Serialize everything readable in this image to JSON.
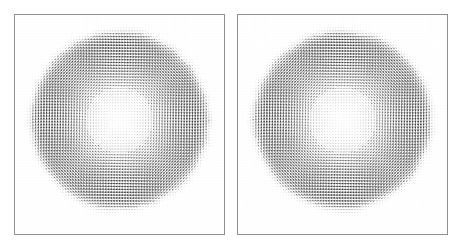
{
  "figure": {
    "title": "",
    "width": 462,
    "height": 247,
    "background_color": "#ffffff",
    "panel_count": 2
  },
  "style": {
    "border_color": "#8f8f8f",
    "border_width": 1,
    "arrow_color": "#1a1a1a",
    "background_grid_color": "#e8e8e8",
    "panel_background": "#ffffff"
  },
  "panels": [
    {
      "name": "left-panel",
      "label": "",
      "x": 14,
      "y": 14,
      "width": 211,
      "height": 221
    },
    {
      "name": "right-panel",
      "label": "",
      "x": 237,
      "y": 14,
      "width": 211,
      "height": 221
    }
  ],
  "chart_data": {
    "type": "scatter",
    "subtype": "quiver-vector-field",
    "title": "",
    "xlabel": "",
    "ylabel": "",
    "xlim": [
      0,
      1
    ],
    "ylim": [
      0,
      1
    ],
    "grid": true,
    "legend": null,
    "tick_labels": {
      "x": [],
      "y": []
    },
    "annotations": [],
    "panels": [
      {
        "name": "left-panel",
        "grid_nx": 76,
        "grid_ny": 76,
        "field": "vortex",
        "rotation": "counter-clockwise",
        "center_norm": [
          0.5,
          0.48
        ],
        "support_radius_norm": 0.225,
        "core_radius_norm": 0.055,
        "peak_radius_norm": 0.185,
        "max_arrow_length_px": 3.6,
        "background_arrow_length_px": 0.45,
        "edge_roughness": 0.035
      },
      {
        "name": "right-panel",
        "grid_nx": 76,
        "grid_ny": 76,
        "field": "vortex",
        "rotation": "counter-clockwise",
        "center_norm": [
          0.5,
          0.48
        ],
        "support_radius_norm": 0.225,
        "core_radius_norm": 0.055,
        "peak_radius_norm": 0.185,
        "max_arrow_length_px": 3.6,
        "background_arrow_length_px": 0.45,
        "edge_roughness": 0.035
      }
    ]
  }
}
